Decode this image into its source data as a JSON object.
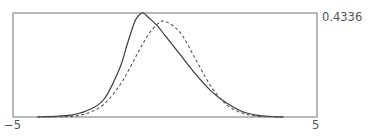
{
  "chart_data": {
    "type": "line",
    "title": "",
    "xlabel": "",
    "ylabel": "",
    "xlim": [
      -5,
      5
    ],
    "ylim": [
      0,
      0.4336
    ],
    "x_tick_labels": [
      "−5",
      "5"
    ],
    "y_tick_labels": [
      "0.4336"
    ],
    "grid": false,
    "legend": null,
    "x": [
      -4.2,
      -3.5,
      -3.0,
      -2.5,
      -2.0,
      -1.5,
      -1.25,
      -1.0,
      -0.85,
      -0.72,
      -0.5,
      -0.25,
      0.0,
      0.5,
      1.0,
      1.5,
      2.0,
      2.5,
      3.0,
      3.5,
      3.9
    ],
    "series": [
      {
        "name": "skewed density",
        "style": "solid",
        "color": "#3a3a3a",
        "values": [
          0.0005,
          0.004,
          0.01,
          0.03,
          0.075,
          0.2,
          0.3,
          0.396,
          0.425,
          0.4336,
          0.41,
          0.38,
          0.34,
          0.26,
          0.18,
          0.11,
          0.06,
          0.025,
          0.008,
          0.002,
          0.0005
        ]
      },
      {
        "name": "standard normal",
        "style": "dashed",
        "color": "#555555",
        "values": [
          0.0001,
          0.001,
          0.004,
          0.018,
          0.054,
          0.13,
          0.183,
          0.242,
          0.278,
          0.307,
          0.352,
          0.387,
          0.399,
          0.352,
          0.242,
          0.13,
          0.054,
          0.018,
          0.004,
          0.001,
          0.0002
        ]
      }
    ]
  },
  "labels": {
    "ymax": "0.4336",
    "xmin": "−5",
    "xmax": "5"
  },
  "frame": {
    "left": 13,
    "top": 13,
    "right": 317,
    "bottom": 117,
    "stroke": "#8a8a8a"
  }
}
